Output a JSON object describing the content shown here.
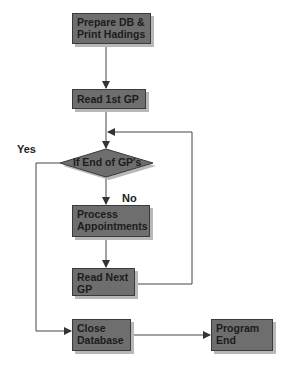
{
  "diagram": {
    "type": "flowchart",
    "nodes": {
      "prepare": {
        "line1": "Prepare DB &",
        "line2": "Print Hadings"
      },
      "read_first": {
        "line1": "Read 1st GP"
      },
      "decision": {
        "line1": "If End of GP's"
      },
      "process": {
        "line1": "Process",
        "line2": "Appointments"
      },
      "read_next": {
        "line1": "Read Next",
        "line2": "GP"
      },
      "close": {
        "line1": "Close",
        "line2": "Database"
      },
      "end": {
        "line1": "Program",
        "line2": "End"
      }
    },
    "edge_labels": {
      "yes": "Yes",
      "no": "No"
    },
    "colors": {
      "box_fill": "#6e6e6e",
      "box_border": "#3a3a3a",
      "shadow": "#b8b8b8",
      "line": "#444444"
    }
  }
}
